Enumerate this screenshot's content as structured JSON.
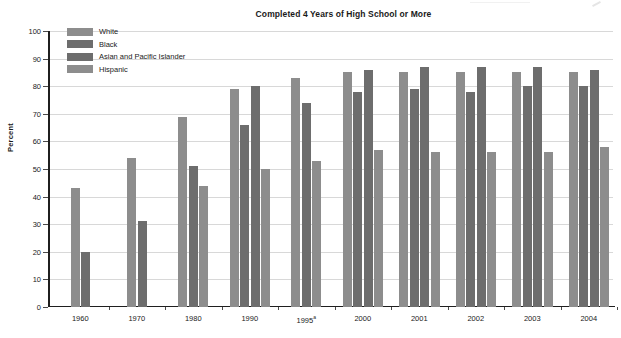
{
  "chart_data": {
    "type": "bar",
    "title": "Completed 4 Years of High School or More",
    "xlabel": "",
    "ylabel": "Percent",
    "ylim": [
      0,
      100
    ],
    "ytick_step": 10,
    "yticks": [
      0,
      10,
      20,
      30,
      40,
      50,
      60,
      70,
      80,
      90,
      100
    ],
    "grid": true,
    "legend_position": "top-left",
    "categories": [
      "1960",
      "1970",
      "1980",
      "1990",
      "1995a",
      "2000",
      "2001",
      "2002",
      "2003",
      "2004"
    ],
    "category_labels": [
      "1960",
      "1970",
      "1980",
      "1990",
      "1995",
      "2000",
      "2001",
      "2002",
      "2003",
      "2004"
    ],
    "category_footnotes": [
      "",
      "",
      "",
      "",
      "a",
      "",
      "",
      "",
      "",
      ""
    ],
    "series": [
      {
        "name": "White",
        "color": "#8d8d8d",
        "values": [
          43,
          54,
          69,
          79,
          83,
          85,
          85,
          85,
          85,
          85
        ]
      },
      {
        "name": "Black",
        "color": "#6d6d6d",
        "values": [
          20,
          31,
          51,
          66,
          null,
          78,
          79,
          78,
          80,
          80
        ]
      },
      {
        "name": "Asian and Pacific Islander",
        "color": "#6d6d6d",
        "values": [
          null,
          null,
          null,
          80,
          74,
          86,
          87,
          87,
          87,
          86
        ]
      },
      {
        "name": "Hispanic",
        "color": "#8d8d8d",
        "values": [
          null,
          null,
          44,
          50,
          53,
          57,
          56,
          56,
          56,
          58
        ]
      }
    ]
  },
  "legend": {
    "items": [
      {
        "label": "White"
      },
      {
        "label": "Black"
      },
      {
        "label": "Asian and Pacific Islander"
      },
      {
        "label": "Hispanic"
      }
    ]
  }
}
